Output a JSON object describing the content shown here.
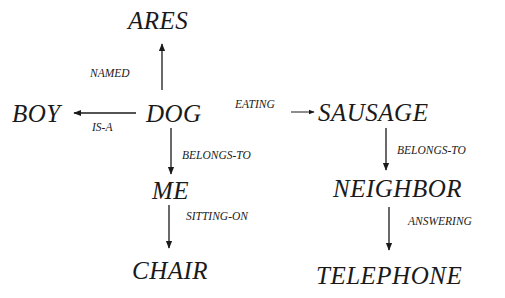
{
  "diagram": {
    "type": "semantic-network",
    "nodes": {
      "ares": "ARES",
      "boy": "BOY",
      "dog": "DOG",
      "sausage": "SAUSAGE",
      "me": "ME",
      "neighbor": "NEIGHBOR",
      "chair": "CHAIR",
      "telephone": "TELEPHONE"
    },
    "edges": {
      "named": "NAMED",
      "is_a": "IS-A",
      "eating": "EATING",
      "dog_belongs_to": "BELONGS-TO",
      "sausage_belongs_to": "BELONGS-TO",
      "sitting_on": "SITTING-ON",
      "answering": "ANSWERING"
    },
    "relations": [
      {
        "from": "DOG",
        "label": "NAMED",
        "to": "ARES"
      },
      {
        "from": "DOG",
        "label": "IS-A",
        "to": "BOY"
      },
      {
        "from": "DOG",
        "label": "EATING",
        "to": "SAUSAGE"
      },
      {
        "from": "DOG",
        "label": "BELONGS-TO",
        "to": "ME"
      },
      {
        "from": "SAUSAGE",
        "label": "BELONGS-TO",
        "to": "NEIGHBOR"
      },
      {
        "from": "ME",
        "label": "SITTING-ON",
        "to": "CHAIR"
      },
      {
        "from": "NEIGHBOR",
        "label": "ANSWERING",
        "to": "TELEPHONE"
      }
    ]
  }
}
